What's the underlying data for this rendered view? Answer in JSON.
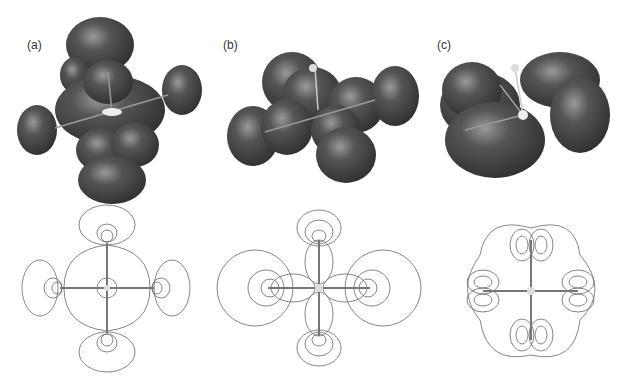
{
  "figure": {
    "panels": [
      {
        "label": "(a)",
        "type": "3d-isosurface",
        "description": "octahedral-like lobes with central atom and bonds"
      },
      {
        "label": "(b)",
        "type": "3d-isosurface",
        "description": "lobes along bonds, larger spheres"
      },
      {
        "label": "(c)",
        "type": "3d-isosurface",
        "description": "four-leaf clover merged lobes"
      }
    ],
    "contour_panels": [
      {
        "name": "contour-a"
      },
      {
        "name": "contour-b"
      },
      {
        "name": "contour-c"
      }
    ],
    "colors": {
      "lobe": "#4a4a4a",
      "lobe_highlight": "#8a8a8a",
      "contour": "#555555",
      "bond": "#666666"
    }
  }
}
